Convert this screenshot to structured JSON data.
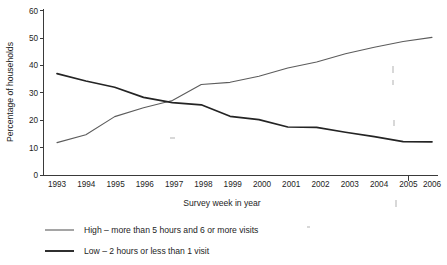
{
  "chart_data": {
    "type": "line",
    "title": "",
    "xlabel": "Survey week in year",
    "ylabel": "Percentage of households",
    "categories": [
      "1993",
      "1994",
      "1995",
      "1996",
      "1997",
      "1998",
      "1999",
      "2000",
      "2001",
      "2002",
      "2003",
      "2004",
      "2005",
      "2006"
    ],
    "x": [
      1993,
      1994,
      1995,
      1996,
      1997,
      1998,
      1999,
      2000,
      2001,
      2002,
      2003,
      2004,
      2005,
      2006
    ],
    "ylim": [
      0,
      60
    ],
    "yticks": [
      0,
      10,
      20,
      30,
      40,
      50,
      60
    ],
    "xticks": [
      "1993",
      "1994",
      "1995",
      "1996",
      "1997",
      "1998",
      "1999",
      "2000",
      "2001",
      "2002",
      "2003",
      "2004",
      "2005",
      "2006"
    ],
    "grid": false,
    "legend_position": "below-left",
    "series": [
      {
        "name": "High – more than 5 hours and 6 or more visits",
        "short_name": "High",
        "color": "#5c5c5c",
        "line_width": 1.1,
        "values": [
          11.8,
          14.7,
          21.3,
          24.5,
          27.2,
          33.0,
          33.8,
          36.0,
          39.0,
          41.2,
          44.2,
          46.6,
          48.7,
          50.2
        ]
      },
      {
        "name": "Low – 2 hours or less than 1 visit",
        "short_name": "Low",
        "color": "#242424",
        "line_width": 1.7,
        "values": [
          37.0,
          34.3,
          32.0,
          28.3,
          26.4,
          25.6,
          21.4,
          20.2,
          17.5,
          17.4,
          15.6,
          14.0,
          12.2,
          12.1
        ]
      }
    ]
  },
  "legend": {
    "items": [
      {
        "label": "High – more than 5 hours and 6 or more visits",
        "color": "#5c5c5c",
        "line_width": 1.1
      },
      {
        "label": "Low – 2 hours or less than 1 visit",
        "color": "#242424",
        "line_width": 1.7
      }
    ]
  },
  "axes": {
    "y_title": "Percentage of households",
    "x_title": "Survey week in year"
  }
}
